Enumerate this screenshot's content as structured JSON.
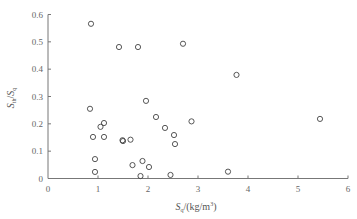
{
  "chart_data": {
    "type": "scatter",
    "title": "",
    "xlabel": "S_q/(kg/m³)",
    "xlabel_parts": {
      "main": "S",
      "sub": "q",
      "rest": "/(kg/m",
      "sup": "3",
      "end": ")"
    },
    "ylabel": "S_th/S_q",
    "ylabel_parts": {
      "main1": "S",
      "sub1": "th",
      "slash": "/",
      "main2": "S",
      "sub2": "q"
    },
    "xlim": [
      0,
      6
    ],
    "ylim": [
      0,
      0.6
    ],
    "x_ticks": [
      "0",
      "1",
      "2",
      "3",
      "4",
      "5",
      "6"
    ],
    "y_ticks": [
      "0",
      "0.1",
      "0.2",
      "0.3",
      "0.4",
      "0.5",
      "0.6"
    ],
    "grid": false,
    "legend": null,
    "marker": "open-circle",
    "series": [
      {
        "name": "data",
        "points": [
          {
            "x": 0.86,
            "y": 0.566
          },
          {
            "x": 1.42,
            "y": 0.481
          },
          {
            "x": 1.8,
            "y": 0.481
          },
          {
            "x": 2.7,
            "y": 0.493
          },
          {
            "x": 3.77,
            "y": 0.379
          },
          {
            "x": 0.84,
            "y": 0.255
          },
          {
            "x": 1.12,
            "y": 0.203
          },
          {
            "x": 1.05,
            "y": 0.189
          },
          {
            "x": 0.9,
            "y": 0.152
          },
          {
            "x": 1.12,
            "y": 0.152
          },
          {
            "x": 0.94,
            "y": 0.071
          },
          {
            "x": 0.94,
            "y": 0.024
          },
          {
            "x": 1.96,
            "y": 0.284
          },
          {
            "x": 2.16,
            "y": 0.225
          },
          {
            "x": 2.34,
            "y": 0.185
          },
          {
            "x": 1.49,
            "y": 0.14
          },
          {
            "x": 1.5,
            "y": 0.137
          },
          {
            "x": 1.65,
            "y": 0.142
          },
          {
            "x": 1.69,
            "y": 0.049
          },
          {
            "x": 1.89,
            "y": 0.064
          },
          {
            "x": 2.02,
            "y": 0.042
          },
          {
            "x": 1.85,
            "y": 0.009
          },
          {
            "x": 2.87,
            "y": 0.209
          },
          {
            "x": 2.52,
            "y": 0.159
          },
          {
            "x": 2.54,
            "y": 0.126
          },
          {
            "x": 2.45,
            "y": 0.013
          },
          {
            "x": 3.6,
            "y": 0.025
          },
          {
            "x": 5.44,
            "y": 0.218
          }
        ]
      }
    ]
  }
}
